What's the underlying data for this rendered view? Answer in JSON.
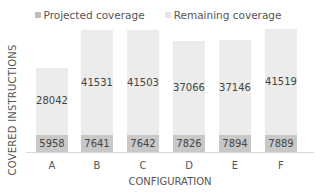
{
  "colors": {
    "projected": "#c8c8c8",
    "remaining": "#ececec",
    "legend_projected": "#bdbdbd",
    "legend_remaining": "#e6e6e6"
  },
  "legend": {
    "projected": "Projected coverage",
    "remaining": "Remaining coverage"
  },
  "axes": {
    "ylabel": "COVERED INSTRUCTIONS",
    "xlabel": "CONFIGURATION"
  },
  "chart_data": {
    "type": "bar",
    "stacked": true,
    "title": "",
    "xlabel": "CONFIGURATION",
    "ylabel": "COVERED INSTRUCTIONS",
    "categories": [
      "A",
      "B",
      "C",
      "D",
      "E",
      "F"
    ],
    "series": [
      {
        "name": "Projected coverage",
        "values": [
          5958,
          7641,
          7642,
          7826,
          7894,
          7889
        ]
      },
      {
        "name": "Remaining coverage",
        "values": [
          28042,
          41531,
          41503,
          37066,
          37146,
          41519
        ]
      }
    ],
    "legend_position": "top",
    "grid": false
  }
}
